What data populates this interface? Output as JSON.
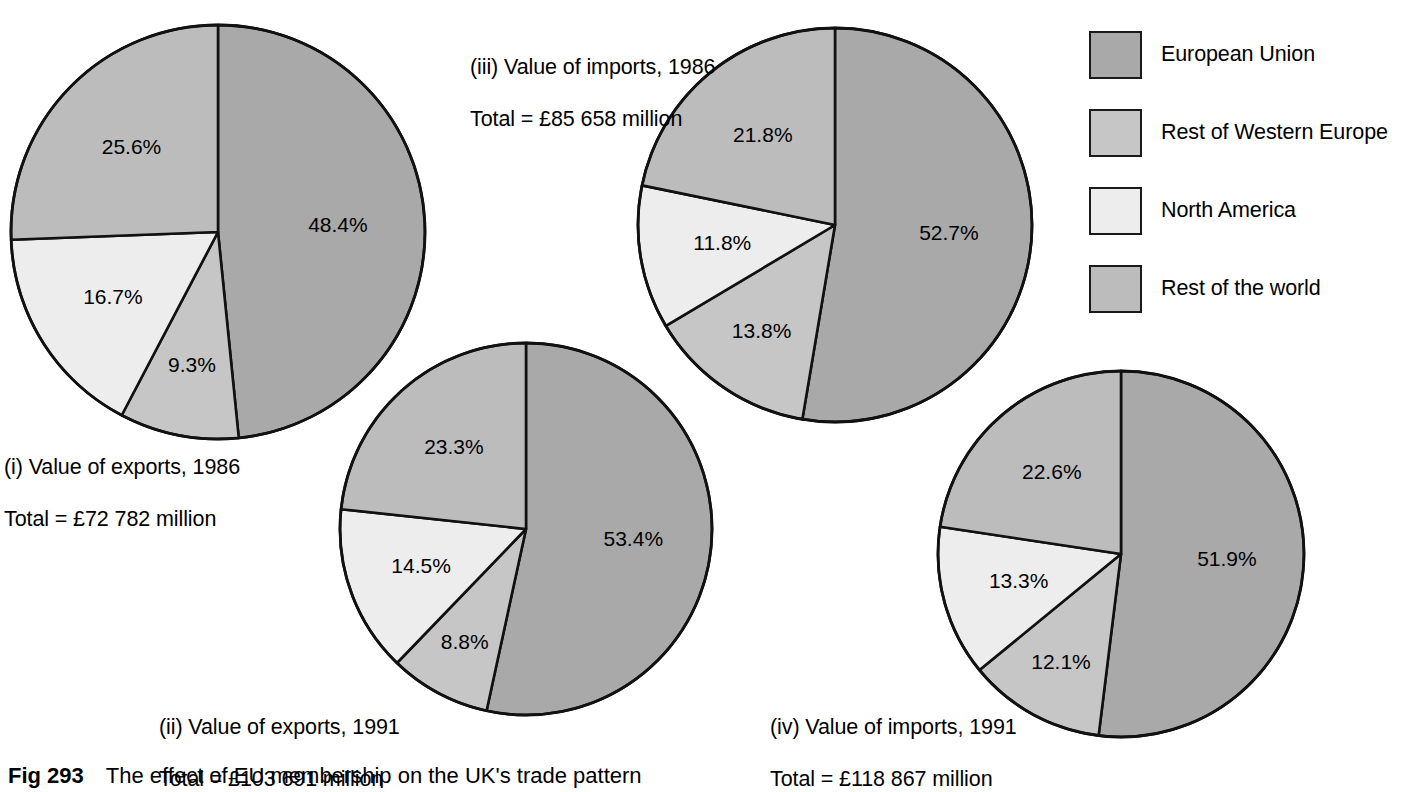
{
  "figure": {
    "number": "Fig 293",
    "caption": "The effect of EU membership on the UK's trade pattern"
  },
  "legend": {
    "position": "top-right",
    "items": [
      {
        "label": "European Union",
        "color": "#a9a9a9",
        "icon": "legend-swatch-icon"
      },
      {
        "label": "Rest of Western Europe",
        "color": "#c6c6c6",
        "icon": "legend-swatch-icon"
      },
      {
        "label": "North America",
        "color": "#ededed",
        "icon": "legend-swatch-icon"
      },
      {
        "label": "Rest of the world",
        "color": "#bcbcbc",
        "icon": "legend-swatch-icon"
      }
    ]
  },
  "chart_data": [
    {
      "id": "pie-i",
      "type": "pie",
      "title": "(i) Value of exports, 1986",
      "subtitle": "Total = £72 782 million",
      "total_label": "Total = £72 782 million",
      "total_value": 72782,
      "total_currency": "£",
      "total_units": "million",
      "categories": [
        "European Union",
        "Rest of Western Europe",
        "North America",
        "Rest of the world"
      ],
      "values": [
        48.4,
        9.3,
        16.7,
        25.6
      ],
      "value_labels": [
        "48.4%",
        "9.3%",
        "16.7%",
        "25.6%"
      ],
      "colors": [
        "#a9a9a9",
        "#c6c6c6",
        "#ededed",
        "#bcbcbc"
      ],
      "start_angle": 0,
      "direction": "clockwise"
    },
    {
      "id": "pie-ii",
      "type": "pie",
      "title": "(ii) Value of exports, 1991",
      "subtitle": "Total = £103 691 million",
      "total_label": "Total = £103 691 million",
      "total_value": 103691,
      "total_currency": "£",
      "total_units": "million",
      "categories": [
        "European Union",
        "Rest of Western Europe",
        "North America",
        "Rest of the world"
      ],
      "values": [
        53.4,
        8.8,
        14.5,
        23.3
      ],
      "value_labels": [
        "53.4%",
        "8.8%",
        "14.5%",
        "23.3%"
      ],
      "colors": [
        "#a9a9a9",
        "#c6c6c6",
        "#ededed",
        "#bcbcbc"
      ],
      "start_angle": 0,
      "direction": "clockwise"
    },
    {
      "id": "pie-iii",
      "type": "pie",
      "title": "(iii) Value of imports, 1986",
      "subtitle": "Total = £85 658 million",
      "total_label": "Total = £85 658 million",
      "total_value": 85658,
      "total_currency": "£",
      "total_units": "million",
      "categories": [
        "European Union",
        "Rest of Western Europe",
        "North America",
        "Rest of the world"
      ],
      "values": [
        52.7,
        13.8,
        11.8,
        21.8
      ],
      "value_labels": [
        "52.7%",
        "13.8%",
        "11.8%",
        "21.8%"
      ],
      "colors": [
        "#a9a9a9",
        "#c6c6c6",
        "#ededed",
        "#bcbcbc"
      ],
      "start_angle": 0,
      "direction": "clockwise"
    },
    {
      "id": "pie-iv",
      "type": "pie",
      "title": "(iv) Value of imports, 1991",
      "subtitle": "Total = £118 867 million",
      "total_label": "Total = £118 867 million",
      "total_value": 118867,
      "total_currency": "£",
      "total_units": "million",
      "categories": [
        "European Union",
        "Rest of Western Europe",
        "North America",
        "Rest of the world"
      ],
      "values": [
        51.9,
        12.1,
        13.3,
        22.6
      ],
      "value_labels": [
        "51.9%",
        "12.1%",
        "13.3%",
        "22.6%"
      ],
      "colors": [
        "#a9a9a9",
        "#c6c6c6",
        "#ededed",
        "#bcbcbc"
      ],
      "start_angle": 0,
      "direction": "clockwise"
    }
  ]
}
